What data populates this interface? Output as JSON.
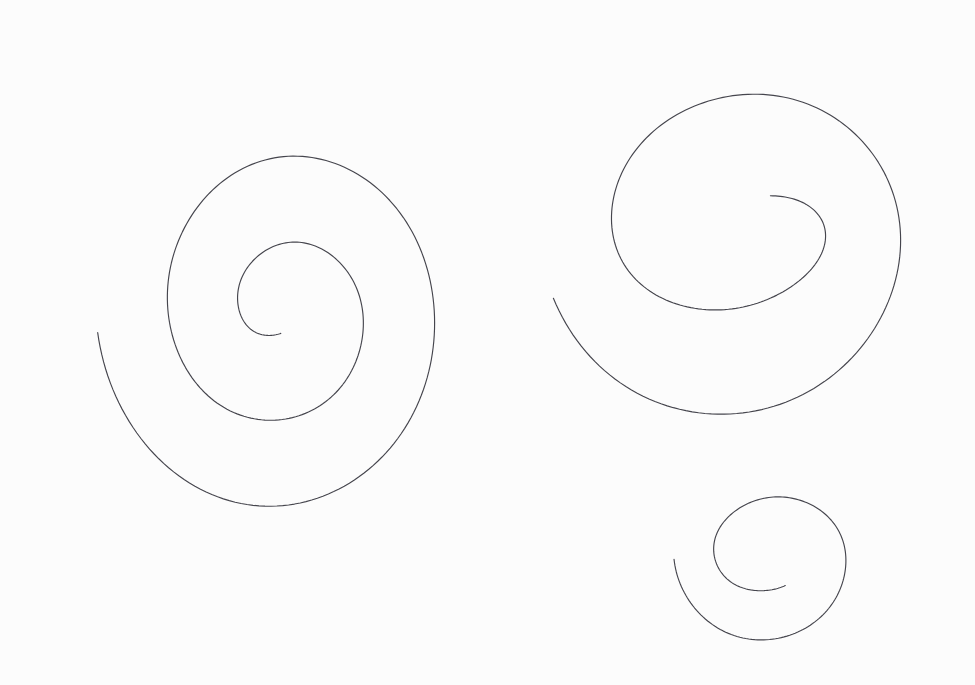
{
  "document": {
    "title": "Hand-drawn spiral sketches",
    "kind": "line-drawing",
    "width": 975,
    "height": 685,
    "background_color": "#fdfdfd",
    "paper_tint": "#fcfcfc",
    "ink_color": "#44444c",
    "stroke_width": 1.15,
    "description": "Three freehand Archimedean spirals drawn in thin dark pencil on near-white paper. No text, labels, axes or UI chrome are present."
  },
  "figures": [
    {
      "id": "spiral-large-left",
      "name": "Large left spiral",
      "winding": "counter-clockwise-inward",
      "center_x": 283,
      "center_y": 310,
      "turns": 2.22,
      "start_radius_x": 186,
      "start_radius_y": 216,
      "end_radius_x": 27,
      "end_radius_y": 24,
      "start_angle_deg": 186,
      "outer_tail_point": [
        102,
        100
      ],
      "inner_terminus_point": [
        310,
        315
      ],
      "bounds": {
        "x_min": 58,
        "x_max": 437,
        "y_min": 136,
        "y_max": 492
      },
      "ink_color": "#45454d",
      "stroke_width": 1.15,
      "jitter": 0.85
    },
    {
      "id": "spiral-upper-right",
      "name": "Upper right spiral",
      "winding": "counter-clockwise-inward",
      "center_x": 737,
      "center_y": 228,
      "turns": 1.62,
      "start_radius_x": 196,
      "start_radius_y": 206,
      "end_radius_x": 74,
      "end_radius_y": 36,
      "start_angle_deg": 200,
      "outer_tail_point": [
        593,
        31
      ],
      "inner_terminus_point": [
        665,
        210
      ],
      "bounds": {
        "x_min": 545,
        "x_max": 928,
        "y_min": 31,
        "y_max": 422
      },
      "ink_color": "#45454d",
      "stroke_width": 1.15,
      "jitter": 0.85
    },
    {
      "id": "spiral-small-lower-right",
      "name": "Small lower right spiral",
      "winding": "counter-clockwise-inward",
      "center_x": 770,
      "center_y": 556,
      "turns": 1.3,
      "start_radius_x": 96,
      "start_radius_y": 95,
      "end_radius_x": 44,
      "end_radius_y": 31,
      "start_angle_deg": 182,
      "outer_tail_point": [
        676,
        556
      ],
      "inner_terminus_point": [
        812,
        583
      ],
      "bounds": {
        "x_min": 676,
        "x_max": 860,
        "y_min": 478,
        "y_max": 650
      },
      "ink_color": "#45454d",
      "stroke_width": 1.15,
      "jitter": 0.8
    }
  ]
}
